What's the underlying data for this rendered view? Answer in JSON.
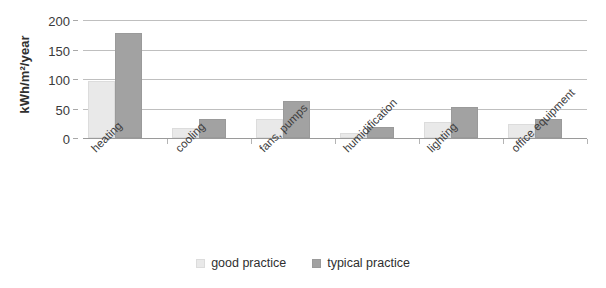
{
  "chart_data": {
    "type": "bar",
    "title": "",
    "xlabel": "",
    "ylabel": "kWh/m²/year",
    "ylim": [
      0,
      200
    ],
    "yticks": [
      0,
      50,
      100,
      150,
      200
    ],
    "ytick_labels": [
      "0",
      "50",
      "100",
      "150",
      "200"
    ],
    "grid": true,
    "legend_position": "bottom-center",
    "categories": [
      "heating",
      "cooling",
      "fans, pumps",
      "humidification",
      "lighting",
      "office equipment"
    ],
    "series": [
      {
        "name": "good practice",
        "color": "#e9e9e9",
        "values": [
          97,
          17,
          32,
          8,
          27,
          24
        ]
      },
      {
        "name": "typical practice",
        "color": "#a2a2a2",
        "values": [
          178,
          33,
          63,
          19,
          53,
          32
        ]
      }
    ]
  },
  "legend": {
    "items": [
      {
        "label": "good practice",
        "swatch": "good"
      },
      {
        "label": "typical practice",
        "swatch": "typical"
      }
    ]
  }
}
